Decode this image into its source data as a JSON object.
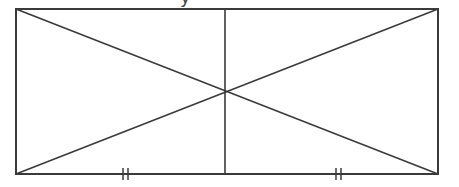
{
  "diagram": {
    "type": "geometry-figure",
    "stroke_color": "#3a3a3a",
    "background": "#ffffff",
    "rectangle": {
      "x1": 16,
      "y1": 9,
      "x2": 438,
      "y2": 174
    },
    "intersection": {
      "x": 225,
      "y": 92
    },
    "vertical_segment": {
      "x": 225,
      "y1": 9,
      "y2": 174
    },
    "tick_marks": [
      {
        "x": 125,
        "y": 174,
        "count": 2
      },
      {
        "x": 338,
        "y": 174,
        "count": 2
      }
    ],
    "caption_fragment": "y"
  }
}
